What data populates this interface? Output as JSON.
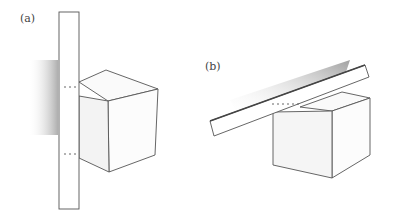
{
  "panels": [
    {
      "label": "(a)",
      "description": "Vertical plank in front of a cube"
    },
    {
      "label": "(b)",
      "description": "Tilted plank resting across a cube"
    }
  ],
  "colors": {
    "stroke": "#555555",
    "shade": "#9a9a9a",
    "background": "#ffffff"
  }
}
